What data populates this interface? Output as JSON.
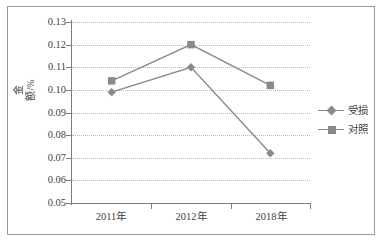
{
  "chart_data": {
    "type": "line",
    "title": "",
    "xlabel": "",
    "ylabel": "金额/%",
    "categories": [
      "2011年",
      "2012年",
      "2018年"
    ],
    "series": [
      {
        "name": "受损",
        "marker": "diamond",
        "color": "#8a8a8a",
        "values": [
          0.099,
          0.11,
          0.072
        ]
      },
      {
        "name": "对照",
        "marker": "square",
        "color": "#8a8a8a",
        "values": [
          0.104,
          0.12,
          0.102
        ]
      }
    ],
    "ylim": [
      0.05,
      0.13
    ],
    "ystep": 0.01,
    "ytick_labels": [
      "0.13",
      "0.12",
      "0.11",
      "0.10",
      "0.09",
      "0.08",
      "0.07",
      "0.06",
      "0.05"
    ],
    "ytick_values": [
      0.13,
      0.12,
      0.11,
      0.1,
      0.09,
      0.08,
      0.07,
      0.06,
      0.05
    ],
    "grid": true,
    "grid_axis": "y",
    "grid_style": "dotted",
    "legend_position": "right",
    "frame": true,
    "colors": {
      "axis": "#7c7c7c",
      "grid": "#b9b9b9",
      "series": "#8a8a8a",
      "text": "#3f3f3f",
      "frame": "#9a9a9a",
      "background": "#ffffff"
    }
  },
  "legend": {
    "items": [
      {
        "label": "受损",
        "marker": "diamond"
      },
      {
        "label": "对照",
        "marker": "square"
      }
    ]
  },
  "axes": {
    "y_title": "金额/%",
    "y_labels": [
      "0.13",
      "0.12",
      "0.11",
      "0.10",
      "0.09",
      "0.08",
      "0.07",
      "0.06",
      "0.05"
    ],
    "x_labels": [
      "2011年",
      "2012年",
      "2018年"
    ]
  }
}
